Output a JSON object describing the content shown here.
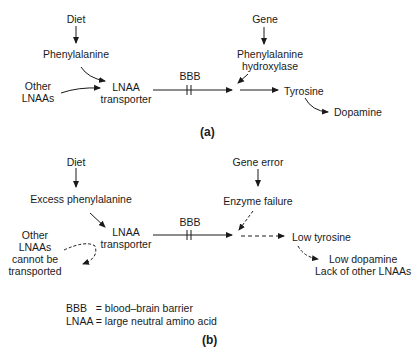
{
  "panel_a": {
    "label": "(a)",
    "nodes": {
      "diet": "Diet",
      "phenylalanine": "Phenylalanine",
      "other_lnaas_1": "Other",
      "other_lnaas_2": "LNAAs",
      "lnaa_transporter_1": "LNAA",
      "lnaa_transporter_2": "transporter",
      "bbb": "BBB",
      "gene": "Gene",
      "enzyme_1": "Phenylalanine",
      "enzyme_2": "hydroxylase",
      "tyrosine": "Tyrosine",
      "dopamine": "Dopamine"
    }
  },
  "panel_b": {
    "label": "(b)",
    "nodes": {
      "diet": "Diet",
      "excess_phenylalanine": "Excess phenylalanine",
      "other_1": "Other",
      "other_2": "LNAAs",
      "other_3": "cannot be",
      "other_4": "transported",
      "lnaa_transporter_1": "LNAA",
      "lnaa_transporter_2": "transporter",
      "bbb": "BBB",
      "gene_error": "Gene error",
      "enzyme_failure": "Enzyme failure",
      "low_tyrosine": "Low tyrosine",
      "low_dopamine": "Low dopamine",
      "lack_lnaas": "Lack of other LNAAs"
    },
    "legend": {
      "line1": "BBB   = blood–brain barrier",
      "line2": "LNAA = large neutral amino acid"
    }
  }
}
